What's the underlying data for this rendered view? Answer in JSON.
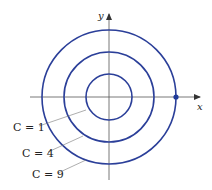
{
  "diagram": {
    "title": "",
    "axes": {
      "x_label": "x",
      "y_label": "y"
    },
    "curves": [
      {
        "label": "C = 1",
        "radius_units": 1
      },
      {
        "label": "C = 4",
        "radius_units": 2
      },
      {
        "label": "C = 9",
        "radius_units": 3
      }
    ],
    "marked_point": {
      "description": "point on outer circle on positive x-axis"
    },
    "colors": {
      "curve": "#2b3f99",
      "axis": "#555555",
      "point": "#1f3a99"
    }
  }
}
